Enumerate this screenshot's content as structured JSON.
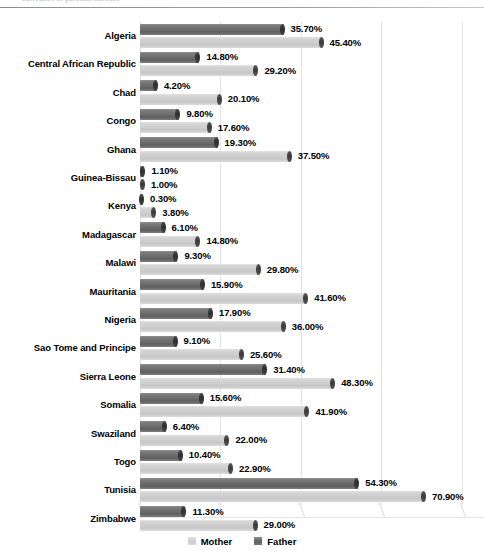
{
  "top_caption": "correlates of parental absence",
  "legend": {
    "position": "bottom-center",
    "items": [
      {
        "label": "Mother",
        "color": "#cfcfcf",
        "icon": "legend-swatch-icon"
      },
      {
        "label": "Father",
        "color": "#6e6e6e",
        "icon": "legend-swatch-icon"
      }
    ]
  },
  "chart_data": {
    "type": "bar",
    "orientation": "horizontal",
    "title": "",
    "subtitle": "",
    "xlabel": "",
    "ylabel": "",
    "xlim": [
      0,
      80
    ],
    "grid": true,
    "value_format": "percent",
    "value_suffix": "%",
    "categories": [
      "Algeria",
      "Central African Republic",
      "Chad",
      "Congo",
      "Ghana",
      "Guinea-Bissau",
      "Kenya",
      "Madagascar",
      "Malawi",
      "Mauritania",
      "Nigeria",
      "Sao Tome and Principe",
      "Sierra Leone",
      "Somalia",
      "Swaziland",
      "Togo",
      "Tunisia",
      "Zimbabwe"
    ],
    "series": [
      {
        "name": "Father",
        "color": "#6e6e6e",
        "values": [
          35.7,
          14.8,
          4.2,
          9.8,
          19.3,
          1.1,
          0.3,
          6.1,
          9.3,
          15.9,
          17.9,
          9.1,
          31.4,
          15.6,
          6.4,
          10.4,
          54.3,
          11.3
        ],
        "labels": [
          "35.70%",
          "14.80%",
          "4.20%",
          "9.80%",
          "19.30%",
          "1.10%",
          "0.30%",
          "6.10%",
          "9.30%",
          "15.90%",
          "17.90%",
          "9.10%",
          "31.40%",
          "15.60%",
          "6.40%",
          "10.40%",
          "54.30%",
          "11.30%"
        ]
      },
      {
        "name": "Mother",
        "color": "#cfcfcf",
        "values": [
          45.4,
          29.2,
          20.1,
          17.6,
          37.5,
          1.0,
          3.8,
          14.8,
          29.8,
          41.6,
          36.0,
          25.6,
          48.3,
          41.9,
          22.0,
          22.9,
          70.9,
          29.0
        ],
        "labels": [
          "45.40%",
          "29.20%",
          "20.10%",
          "17.60%",
          "37.50%",
          "1.00%",
          "3.80%",
          "14.80%",
          "29.80%",
          "41.60%",
          "36.00%",
          "25.60%",
          "48.30%",
          "41.90%",
          "22.00%",
          "22.90%",
          "70.90%",
          "29.00%"
        ]
      }
    ]
  }
}
